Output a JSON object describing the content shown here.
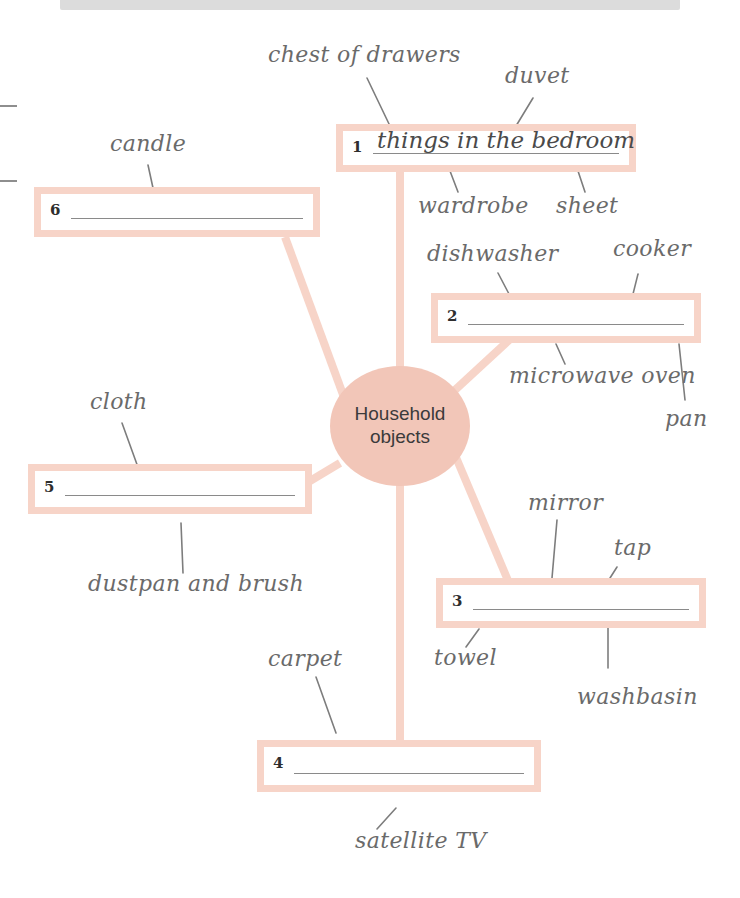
{
  "page": {
    "header_strip_text": "",
    "background_color": "#ffffff",
    "accent_color": "#f7d4c8",
    "bubble_color": "#f2c6b8",
    "rule_color": "#8a8a8a"
  },
  "center": {
    "line1": "Household",
    "line2": "objects"
  },
  "boxes": [
    {
      "number": "1",
      "answer": "things in the bedroom"
    },
    {
      "number": "2",
      "answer": ""
    },
    {
      "number": "3",
      "answer": ""
    },
    {
      "number": "4",
      "answer": ""
    },
    {
      "number": "5",
      "answer": ""
    },
    {
      "number": "6",
      "answer": ""
    }
  ],
  "words": [
    {
      "text": "chest of drawers"
    },
    {
      "text": "duvet"
    },
    {
      "text": "candle"
    },
    {
      "text": "wardrobe"
    },
    {
      "text": "sheet"
    },
    {
      "text": "dishwasher"
    },
    {
      "text": "cooker"
    },
    {
      "text": "microwave oven"
    },
    {
      "text": "pan"
    },
    {
      "text": "cloth"
    },
    {
      "text": "mirror"
    },
    {
      "text": "tap"
    },
    {
      "text": "dustpan and brush"
    },
    {
      "text": "towel"
    },
    {
      "text": "washbasin"
    },
    {
      "text": "carpet"
    },
    {
      "text": "satellite TV"
    }
  ]
}
